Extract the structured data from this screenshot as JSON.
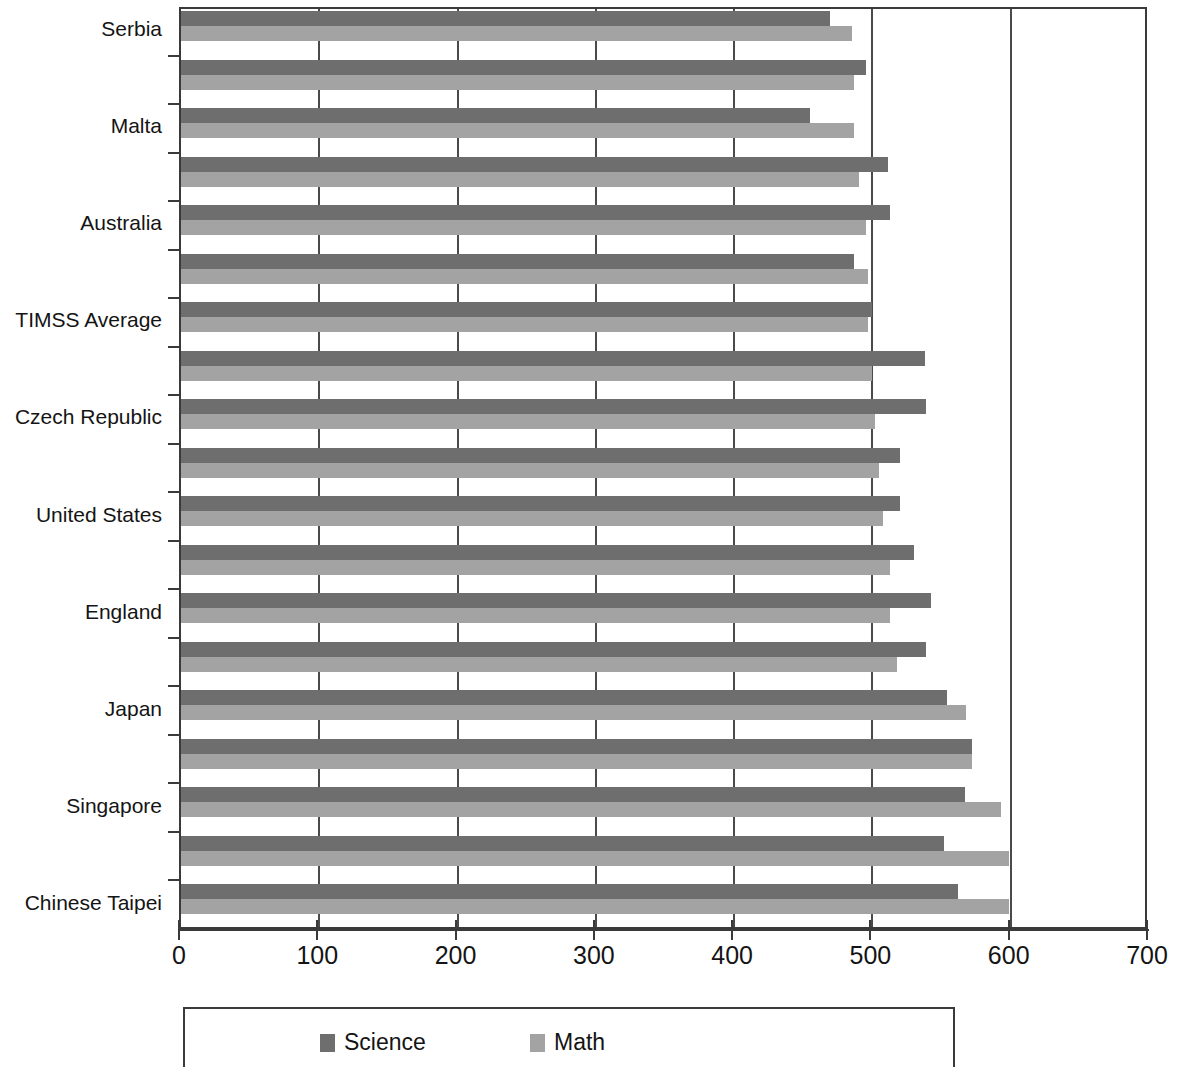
{
  "chart_data": {
    "type": "bar",
    "orientation": "horizontal",
    "title": "",
    "xlabel": "",
    "ylabel": "",
    "xlim": [
      0,
      700
    ],
    "xticks": [
      0,
      100,
      200,
      300,
      400,
      500,
      600,
      700
    ],
    "xtick_labels": [
      "0",
      "100",
      "200",
      "300",
      "400",
      "500",
      "600",
      "700"
    ],
    "grid": "vertical gridlines at 100,200,300,400,500,600",
    "legend": {
      "position": "below-axis",
      "entries": [
        {
          "name": "Science",
          "color": "#6e6e6e"
        },
        {
          "name": "Math",
          "color": "#a3a3a3"
        }
      ]
    },
    "series": [
      {
        "name": "Science",
        "color": "#6e6e6e"
      },
      {
        "name": "Math",
        "color": "#a3a3a3"
      }
    ],
    "categories": [
      "Serbia",
      "",
      "Malta",
      "",
      "Australia",
      "",
      "TIMSS Average",
      "",
      "Czech Republic",
      "",
      "United States",
      "",
      "England",
      "",
      "Japan",
      "",
      "Singapore",
      "",
      "Chinese Taipei"
    ],
    "labeled_categories": [
      "Serbia",
      "Malta",
      "Australia",
      "TIMSS Average",
      "Czech Republic",
      "United States",
      "England",
      "Japan",
      "Singapore",
      "Chinese Taipei"
    ],
    "rows": [
      {
        "label": "Serbia",
        "science": 469,
        "math": 485
      },
      {
        "label": "",
        "science": 495,
        "math": 487
      },
      {
        "label": "Malta",
        "science": 455,
        "math": 487
      },
      {
        "label": "",
        "science": 511,
        "math": 490
      },
      {
        "label": "Australia",
        "science": 513,
        "math": 495
      },
      {
        "label": "",
        "science": 487,
        "math": 497
      },
      {
        "label": "TIMSS Average",
        "science": 500,
        "math": 497
      },
      {
        "label": "",
        "science": 538,
        "math": 500
      },
      {
        "label": "Czech Republic",
        "science": 539,
        "math": 502
      },
      {
        "label": "",
        "science": 520,
        "math": 505
      },
      {
        "label": "United States",
        "science": 520,
        "math": 508
      },
      {
        "label": "",
        "science": 530,
        "math": 513
      },
      {
        "label": "England",
        "science": 542,
        "math": 513
      },
      {
        "label": "",
        "science": 539,
        "math": 518
      },
      {
        "label": "Japan",
        "science": 554,
        "math": 568
      },
      {
        "label": "",
        "science": 572,
        "math": 572
      },
      {
        "label": "Singapore",
        "science": 567,
        "math": 593
      },
      {
        "label": "",
        "science": 552,
        "math": 599
      },
      {
        "label": "Chinese Taipei",
        "science": 562,
        "math": 599
      }
    ]
  }
}
